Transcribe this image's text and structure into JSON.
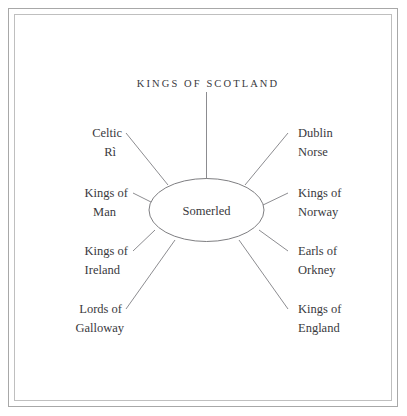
{
  "diagram": {
    "type": "radial-relationship",
    "title": "KINGS OF SCOTLAND",
    "center": {
      "label": "Somerled"
    },
    "nodes": [
      {
        "id": "kings-of-scotland",
        "label": "KINGS OF SCOTLAND",
        "side": "top",
        "lines": [
          "KINGS OF SCOTLAND"
        ]
      },
      {
        "id": "celtic-ri",
        "label": "Celtic Rì",
        "side": "left",
        "lines": [
          "Celtic",
          "Rì"
        ]
      },
      {
        "id": "kings-of-man",
        "label": "Kings of Man",
        "side": "left",
        "lines": [
          "Kings of",
          "Man"
        ]
      },
      {
        "id": "kings-of-ireland",
        "label": "Kings of Ireland",
        "side": "left",
        "lines": [
          "Kings of",
          "Ireland"
        ]
      },
      {
        "id": "lords-of-galloway",
        "label": "Lords of Galloway",
        "side": "left",
        "lines": [
          "Lords of",
          "Galloway"
        ]
      },
      {
        "id": "dublin-norse",
        "label": "Dublin Norse",
        "side": "right",
        "lines": [
          "Dublin",
          "Norse"
        ]
      },
      {
        "id": "kings-of-norway",
        "label": "Kings of Norway",
        "side": "right",
        "lines": [
          "Kings of",
          "Norway"
        ]
      },
      {
        "id": "earls-of-orkney",
        "label": "Earls of Orkney",
        "side": "right",
        "lines": [
          "Earls of",
          "Orkney"
        ]
      },
      {
        "id": "kings-of-england",
        "label": "Kings of England",
        "side": "right",
        "lines": [
          "Kings of",
          "England"
        ]
      }
    ],
    "colors": {
      "background": "#ffffff",
      "line": "#6f6f73",
      "text": "#39393d",
      "frame_outer": "#a8a8a8",
      "frame_inner": "#bfbfbf"
    }
  }
}
